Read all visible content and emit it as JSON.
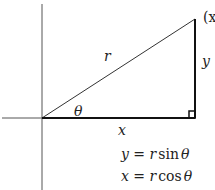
{
  "diagram": {
    "type": "polar-to-cartesian right triangle",
    "labels": {
      "hypotenuse": "r",
      "vertical_leg": "y",
      "horizontal_leg": "x",
      "angle": "θ",
      "point": "(x"
    },
    "equations": [
      {
        "lhs": "y",
        "eq": " = ",
        "coef": "r",
        "fn": "sin",
        "arg": "θ"
      },
      {
        "lhs": "x",
        "eq": " = ",
        "coef": "r",
        "fn": "cos",
        "arg": "θ"
      }
    ],
    "colors": {
      "stroke": "#222222",
      "axis": "#555555",
      "background": "#ffffff"
    }
  }
}
